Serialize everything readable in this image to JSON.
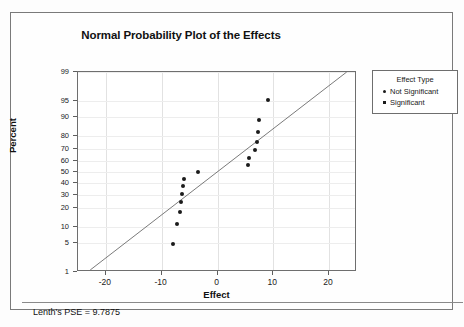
{
  "chart_data": {
    "type": "scatter",
    "title": "Normal Probability Plot of the Effects",
    "xlabel": "Effect",
    "ylabel": "Percent",
    "xlim": [
      -25,
      25
    ],
    "ylim": [
      1,
      99
    ],
    "yscale": "normal-probability",
    "grid": true,
    "legend_position": "right",
    "x_ticks": [
      "-20",
      "-10",
      "0",
      "10",
      "20"
    ],
    "x_tick_values": [
      -20,
      -10,
      0,
      10,
      20
    ],
    "y_ticks": [
      "99",
      "95",
      "90",
      "80",
      "70",
      "60",
      "50",
      "40",
      "30",
      "20",
      "10",
      "5",
      "1"
    ],
    "y_tick_values": [
      99,
      95,
      90,
      80,
      70,
      60,
      50,
      40,
      30,
      20,
      10,
      5,
      1
    ],
    "series": [
      {
        "name": "Not Significant",
        "marker": "circle",
        "color": "#1b1b1b",
        "points": [
          {
            "x": -8.0,
            "y": 4.7
          },
          {
            "x": -7.3,
            "y": 11.3
          },
          {
            "x": -6.8,
            "y": 17.8
          },
          {
            "x": -6.5,
            "y": 24.3
          },
          {
            "x": -6.4,
            "y": 30.5
          },
          {
            "x": -6.2,
            "y": 37.2
          },
          {
            "x": -6.0,
            "y": 43.8
          },
          {
            "x": -3.5,
            "y": 50.3
          },
          {
            "x": 5.5,
            "y": 56.8
          },
          {
            "x": 5.7,
            "y": 63.2
          },
          {
            "x": 6.8,
            "y": 69.7
          },
          {
            "x": 7.0,
            "y": 76.0
          },
          {
            "x": 7.2,
            "y": 82.3
          },
          {
            "x": 7.5,
            "y": 88.8
          },
          {
            "x": 9.0,
            "y": 95.3
          }
        ]
      },
      {
        "name": "Significant",
        "marker": "square",
        "color": "#1b1b1b",
        "points": []
      }
    ],
    "reference_line": {
      "x_start": -22.8,
      "y_start": 1.0,
      "x_end": 23.5,
      "y_end": 99.0,
      "color": "#6a6a6a"
    },
    "annotations": [
      "Lenth's PSE = 9.7875"
    ]
  },
  "legend": {
    "title": "Effect Type",
    "entries": [
      {
        "label": "Not Significant",
        "marker": "circle"
      },
      {
        "label": "Significant",
        "marker": "square"
      }
    ]
  },
  "footer": {
    "lenth_pse": "Lenth's PSE = 9.7875"
  }
}
